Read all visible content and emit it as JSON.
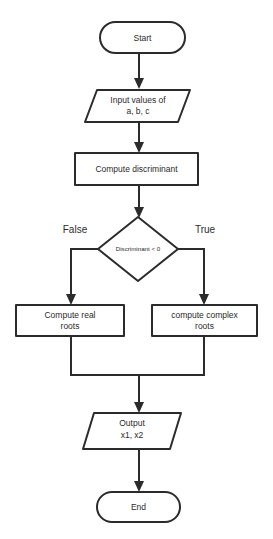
{
  "diagram": {
    "type": "flowchart",
    "background_color": "#ffffff",
    "stroke_color": "#2b2b2b",
    "text_color": "#2b2b2b",
    "nodes": [
      {
        "id": "start",
        "shape": "terminator",
        "label": "Start"
      },
      {
        "id": "input",
        "shape": "parallelogram",
        "label_line1": "Input values of",
        "label_line2": "a, b, c"
      },
      {
        "id": "compute_discriminant",
        "shape": "rectangle",
        "label": "Compute discriminant"
      },
      {
        "id": "decision",
        "shape": "diamond",
        "label": "Discriminant < 0"
      },
      {
        "id": "compute_real",
        "shape": "rectangle",
        "label_line1": "Compute real",
        "label_line2": "roots"
      },
      {
        "id": "compute_complex",
        "shape": "rectangle",
        "label_line1": "compute complex",
        "label_line2": "roots"
      },
      {
        "id": "output",
        "shape": "parallelogram",
        "label_line1": "Output",
        "label_line2": "x1, x2"
      },
      {
        "id": "end",
        "shape": "terminator",
        "label": "End"
      }
    ],
    "branch_labels": {
      "false": "False",
      "true": "True"
    }
  }
}
